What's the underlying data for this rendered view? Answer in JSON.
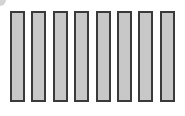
{
  "bars": {
    "count": 8,
    "fill_color": "#c8c8c8",
    "border_color": "#3a3a3a",
    "items": [
      {
        "index": 1
      },
      {
        "index": 2
      },
      {
        "index": 3
      },
      {
        "index": 4
      },
      {
        "index": 5
      },
      {
        "index": 6
      },
      {
        "index": 7
      },
      {
        "index": 8
      }
    ]
  }
}
